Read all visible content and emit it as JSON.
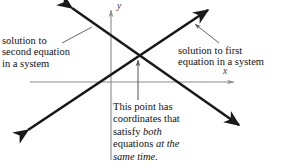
{
  "figure": {
    "background_color": "#ffffff",
    "line_color": "#1a1a1a",
    "axis_color": "#8c8c8c",
    "leader_color": "#555555",
    "text_color": "#111111"
  },
  "axes": {
    "x_label": "x",
    "y_label": "y",
    "x_axis": {
      "x1": 30,
      "y1": 82,
      "x2": 238,
      "y2": 82
    },
    "y_axis": {
      "x1": 111,
      "y1": 160,
      "x2": 111,
      "y2": 6
    }
  },
  "lines": [
    {
      "name": "first-equation-line",
      "description": "line rising to the upper right",
      "from": {
        "x": 24,
        "y": 133
      },
      "to": {
        "x": 212,
        "y": 6
      },
      "arrow_both_ends": true
    },
    {
      "name": "second-equation-line",
      "description": "line falling to the lower right",
      "from": {
        "x": 68,
        "y": 5
      },
      "to": {
        "x": 243,
        "y": 128
      },
      "arrow_both_ends": true
    }
  ],
  "intersection": {
    "x": 137,
    "y": 55
  },
  "annotations": {
    "second_equation": {
      "name": "solution-to-second-equation",
      "lines": [
        "solution to",
        "second equation",
        "in a system"
      ],
      "leader": {
        "x1": 62,
        "y1": 43,
        "x2": 92,
        "y2": 27
      }
    },
    "first_equation": {
      "name": "solution-to-first-equation",
      "lines": [
        "solution to first",
        "equation in a system"
      ],
      "leader": {
        "x1": 219,
        "y1": 43,
        "x2": 192,
        "y2": 22
      }
    },
    "intersection_point": {
      "name": "intersection-point-note",
      "lines": [
        {
          "plain": "This point has",
          "italic": ""
        },
        {
          "plain": "coordinates that",
          "italic": ""
        },
        {
          "plain": "satisfy ",
          "italic": "both"
        },
        {
          "plain": "equations ",
          "italic": "at the"
        },
        {
          "plain": "",
          "italic": "same time."
        }
      ],
      "pointer": {
        "x1": 138,
        "y1": 100,
        "x2": 138,
        "y2": 57
      }
    }
  }
}
